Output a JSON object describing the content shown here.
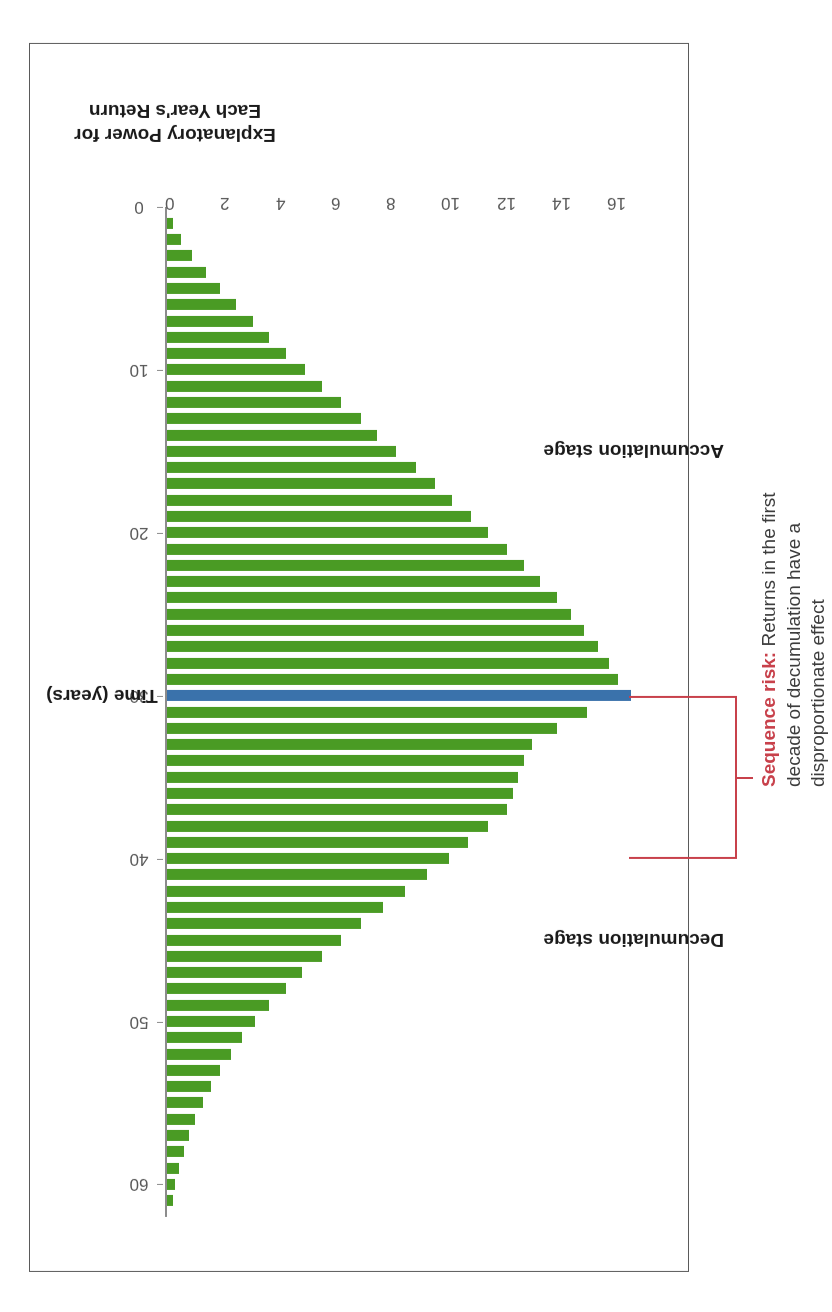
{
  "chart_data": {
    "type": "bar",
    "title": "",
    "subtitle": "",
    "orientation": "vertical-rotated-180",
    "xlabel": "Time (years)",
    "ylabel": "Explanatory Power for Each Year's Return",
    "ylabel_line1": "Explanatory Power for",
    "ylabel_line2": "Each Year's Return",
    "xlim": [
      0,
      62
    ],
    "ylim": [
      0,
      17
    ],
    "xticks": [
      0,
      10,
      20,
      30,
      40,
      50,
      60
    ],
    "xticklabels": [
      "0",
      "10",
      "20",
      "30",
      "40",
      "50",
      "60"
    ],
    "yticks": [
      0,
      2,
      4,
      6,
      8,
      10,
      12,
      14,
      16
    ],
    "yticklabels": [
      "0",
      "2",
      "4",
      "6",
      "8",
      "10",
      "12",
      "14",
      "16"
    ],
    "grid": false,
    "legend": false,
    "series": [
      {
        "name": "Explanatory power",
        "color": "#4a9b24",
        "highlight_color": "#3a72ab",
        "highlight_x": 30,
        "x": [
          1,
          2,
          3,
          4,
          5,
          6,
          7,
          8,
          9,
          10,
          11,
          12,
          13,
          14,
          15,
          16,
          17,
          18,
          19,
          20,
          21,
          22,
          23,
          24,
          25,
          26,
          27,
          28,
          29,
          30,
          31,
          32,
          33,
          34,
          35,
          36,
          37,
          38,
          39,
          40,
          41,
          42,
          43,
          44,
          45,
          46,
          47,
          48,
          49,
          50,
          51,
          52,
          53,
          54,
          55,
          56,
          57,
          58,
          59,
          60,
          61
        ],
        "values": [
          0.2,
          0.5,
          0.9,
          1.4,
          1.9,
          2.5,
          3.1,
          3.7,
          4.3,
          5.0,
          5.6,
          6.3,
          7.0,
          7.6,
          8.3,
          9.0,
          9.7,
          10.3,
          11.0,
          11.6,
          12.3,
          12.9,
          13.5,
          14.1,
          14.6,
          15.1,
          15.6,
          16.0,
          16.3,
          16.8,
          15.2,
          14.1,
          13.2,
          12.9,
          12.7,
          12.5,
          12.3,
          11.6,
          10.9,
          10.2,
          9.4,
          8.6,
          7.8,
          7.0,
          6.3,
          5.6,
          4.9,
          4.3,
          3.7,
          3.2,
          2.7,
          2.3,
          1.9,
          1.6,
          1.3,
          1.0,
          0.8,
          0.6,
          0.45,
          0.3,
          0.2
        ]
      }
    ],
    "annotations": [
      {
        "name": "sequence-risk-note",
        "bold_text": "Sequence risk:",
        "text": " Returns in the first decade of decumulation have a disproportionate effect",
        "full_text": "Sequence risk: Returns in the first decade of decumulation have a disproportionate effect",
        "bracket_from_x": 30,
        "bracket_to_x": 40,
        "color": "#c8414b"
      },
      {
        "name": "accumulation-stage-label",
        "text": "Accumulation stage",
        "x_center": 15
      },
      {
        "name": "decumulation-stage-label",
        "text": "Decumulation stage",
        "x_center": 45
      }
    ]
  },
  "axis": {
    "x_title": "Time (years)",
    "y_title_line1": "Explanatory Power for",
    "y_title_line2": "Each Year's Return"
  },
  "labels": {
    "accumulation": "Accumulation stage",
    "decumulation": "Decumulation stage"
  },
  "annotation": {
    "bold": "Sequence risk:",
    "rest": " Returns in the first decade of decumulation have a disproportionate effect"
  },
  "colors": {
    "bar_green": "#4a9b24",
    "bar_blue": "#3a72ab",
    "accent_red": "#c8414b",
    "axis_gray": "#8c8c8c",
    "text_dark": "#1a1a1a",
    "frame": "#5a5a5a"
  }
}
